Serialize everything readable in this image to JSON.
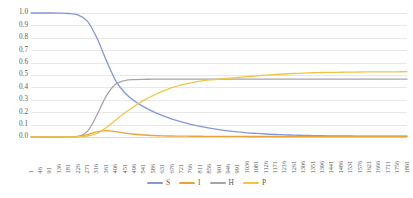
{
  "chart_data": {
    "type": "line",
    "title": "",
    "subtitle": "",
    "xlabel": "",
    "ylabel": "",
    "xlim": [
      1,
      1801
    ],
    "ylim": [
      0.0,
      1.0
    ],
    "grid": true,
    "legend_position": "bottom",
    "y_ticks": [
      "1.0",
      "0.9",
      "0.8",
      "0.7",
      "0.6",
      "0.5",
      "0.4",
      "0.3",
      "0.2",
      "0.1",
      "0.0"
    ],
    "y_tick_values": [
      1.0,
      0.9,
      0.8,
      0.7,
      0.6,
      0.5,
      0.4,
      0.3,
      0.2,
      0.1,
      0.0
    ],
    "categories": [
      1,
      46,
      91,
      136,
      181,
      226,
      271,
      316,
      361,
      406,
      451,
      496,
      541,
      586,
      631,
      676,
      721,
      766,
      811,
      856,
      901,
      946,
      991,
      1036,
      1081,
      1126,
      1171,
      1216,
      1261,
      1306,
      1351,
      1396,
      1441,
      1486,
      1531,
      1576,
      1621,
      1666,
      1711,
      1756,
      1801
    ],
    "series": [
      {
        "name": "S",
        "color": "#8497D6",
        "values": [
          1.0,
          1.0,
          1.0,
          0.999,
          0.996,
          0.985,
          0.935,
          0.8,
          0.62,
          0.455,
          0.355,
          0.29,
          0.243,
          0.205,
          0.172,
          0.145,
          0.122,
          0.102,
          0.085,
          0.071,
          0.059,
          0.049,
          0.041,
          0.034,
          0.029,
          0.024,
          0.02,
          0.017,
          0.015,
          0.013,
          0.011,
          0.01,
          0.009,
          0.008,
          0.008,
          0.007,
          0.007,
          0.007,
          0.006,
          0.006,
          0.006
        ]
      },
      {
        "name": "I",
        "color": "#E8A33D",
        "values": [
          0.0,
          0.0,
          0.0,
          0.0,
          0.001,
          0.004,
          0.02,
          0.042,
          0.051,
          0.044,
          0.032,
          0.022,
          0.016,
          0.012,
          0.009,
          0.008,
          0.007,
          0.006,
          0.006,
          0.005,
          0.005,
          0.005,
          0.005,
          0.004,
          0.004,
          0.004,
          0.004,
          0.004,
          0.004,
          0.004,
          0.004,
          0.004,
          0.004,
          0.004,
          0.004,
          0.004,
          0.004,
          0.004,
          0.004,
          0.004,
          0.004
        ]
      },
      {
        "name": "H",
        "color": "#A5A5A5",
        "values": [
          0.0,
          0.0,
          0.0,
          0.0,
          0.001,
          0.005,
          0.045,
          0.175,
          0.33,
          0.425,
          0.455,
          0.463,
          0.465,
          0.466,
          0.466,
          0.466,
          0.466,
          0.466,
          0.466,
          0.466,
          0.466,
          0.466,
          0.466,
          0.466,
          0.466,
          0.466,
          0.466,
          0.466,
          0.466,
          0.466,
          0.466,
          0.466,
          0.466,
          0.466,
          0.466,
          0.466,
          0.466,
          0.466,
          0.466,
          0.466,
          0.466
        ]
      },
      {
        "name": "P",
        "color": "#F2C444",
        "values": [
          0.0,
          0.0,
          0.0,
          0.0,
          0.0,
          0.002,
          0.008,
          0.028,
          0.075,
          0.135,
          0.195,
          0.248,
          0.295,
          0.335,
          0.37,
          0.398,
          0.42,
          0.437,
          0.45,
          0.46,
          0.467,
          0.473,
          0.48,
          0.487,
          0.493,
          0.499,
          0.504,
          0.508,
          0.512,
          0.515,
          0.518,
          0.52,
          0.521,
          0.522,
          0.523,
          0.524,
          0.525,
          0.525,
          0.526,
          0.526,
          0.527
        ]
      }
    ],
    "legend": [
      {
        "label": "S",
        "color": "#8497D6"
      },
      {
        "label": "I",
        "color": "#E8A33D"
      },
      {
        "label": "H",
        "color": "#A5A5A5"
      },
      {
        "label": "P",
        "color": "#F2C444"
      }
    ]
  }
}
